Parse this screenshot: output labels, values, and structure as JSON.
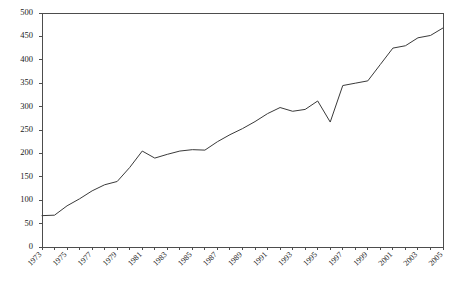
{
  "chart_data": {
    "type": "line",
    "title": "",
    "subtitle": "",
    "xlabel": "",
    "ylabel": "",
    "xlim": [
      1973,
      2005
    ],
    "ylim": [
      0,
      500
    ],
    "yticks": [
      0,
      50,
      100,
      150,
      200,
      250,
      300,
      350,
      400,
      450,
      500
    ],
    "ytick_labels": [
      "0",
      "50",
      "100",
      "150",
      "200",
      "250",
      "300",
      "350",
      "400",
      "450",
      "500"
    ],
    "xticks": [
      1973,
      1974,
      1975,
      1976,
      1977,
      1978,
      1979,
      1980,
      1981,
      1982,
      1983,
      1984,
      1985,
      1986,
      1987,
      1988,
      1989,
      1990,
      1991,
      1992,
      1993,
      1994,
      1995,
      1996,
      1997,
      1998,
      1999,
      2000,
      2001,
      2002,
      2003,
      2004,
      2005
    ],
    "xtick_labels": [
      "1973",
      "1975",
      "1977",
      "1979",
      "1981",
      "1983",
      "1985",
      "1987",
      "1989",
      "1991",
      "1993",
      "1995",
      "1997",
      "1999",
      "2001",
      "2003",
      "2005"
    ],
    "xtick_labels_years": [
      1973,
      1975,
      1977,
      1979,
      1981,
      1983,
      1985,
      1987,
      1989,
      1991,
      1993,
      1995,
      1997,
      1999,
      2001,
      2003,
      2005
    ],
    "xtick_label_rotation_deg": 45,
    "grid": false,
    "legend": false,
    "legend_position": "none",
    "line_color": "#3a3a3a",
    "axis_color": "#4d4d4d",
    "background_color": "#ffffff",
    "x": [
      1973,
      1974,
      1975,
      1976,
      1977,
      1978,
      1979,
      1980,
      1981,
      1982,
      1983,
      1984,
      1985,
      1986,
      1987,
      1988,
      1989,
      1990,
      1991,
      1992,
      1993,
      1994,
      1995,
      1996,
      1997,
      1998,
      1999,
      2000,
      2001,
      2002,
      2003,
      2004,
      2005
    ],
    "values": [
      67,
      68,
      88,
      103,
      120,
      133,
      140,
      170,
      205,
      190,
      198,
      205,
      208,
      207,
      225,
      240,
      253,
      268,
      285,
      298,
      290,
      294,
      312,
      267,
      345,
      350,
      355,
      390,
      425,
      430,
      447,
      452,
      468
    ],
    "series": [
      {
        "name": "",
        "values": [
          67,
          68,
          88,
          103,
          120,
          133,
          140,
          170,
          205,
          190,
          198,
          205,
          208,
          207,
          225,
          240,
          253,
          268,
          285,
          298,
          290,
          294,
          312,
          267,
          345,
          350,
          355,
          390,
          425,
          430,
          447,
          452,
          468
        ]
      }
    ]
  }
}
